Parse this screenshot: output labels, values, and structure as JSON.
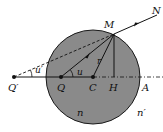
{
  "diagram": {
    "type": "refraction-at-spherical-surface",
    "colors": {
      "sphere_fill": "#8a8a8a",
      "sphere_stroke": "#1a1a1a",
      "line": "#111111",
      "background": "#ffffff"
    },
    "labels": {
      "M": "M",
      "N": "N",
      "Q_prime": "Q′",
      "Q": "Q",
      "C": "C",
      "H": "H",
      "A": "A",
      "r": "r",
      "u": "u",
      "u_prime": "u′",
      "n": "n",
      "n_prime": "n′"
    },
    "points": {
      "Q_prime": [
        14,
        77
      ],
      "Q": [
        61,
        77
      ],
      "C": [
        93,
        77
      ],
      "H": [
        114,
        77
      ],
      "M": [
        114,
        34
      ],
      "N": [
        157,
        15
      ]
    },
    "sphere": {
      "center": [
        93,
        77
      ],
      "radius": 47
    }
  }
}
